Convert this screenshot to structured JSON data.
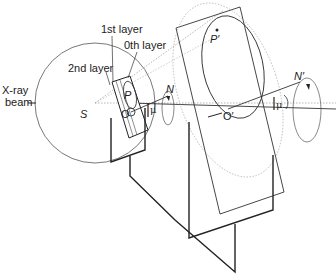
{
  "diagram": {
    "labels": {
      "xray": "X-ray",
      "beam": "beam",
      "layer1": "1st layer",
      "layer0": "0th layer",
      "layer2": "2nd layer",
      "source": "S",
      "point_p": "P",
      "origin_o": "O",
      "normal_n": "N",
      "mu_near": "μ",
      "point_p_prime": "P′",
      "origin_o_prime": "O′",
      "normal_n_prime": "N′",
      "mu_far": "μ"
    },
    "colors": {
      "line": "#222222",
      "thin": "#555555",
      "dotted": "#999999"
    }
  }
}
